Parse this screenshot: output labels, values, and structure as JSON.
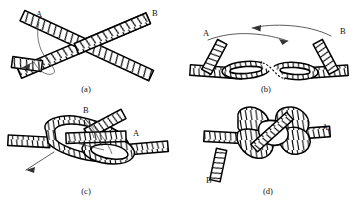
{
  "figure": {
    "background_color": "#ffffff",
    "ink_color": "#000000",
    "arrow_color": "#4a4a4a",
    "width": 356,
    "height": 203
  },
  "panels": [
    {
      "id": "a",
      "caption": "(a)",
      "caption_x": 86,
      "caption_y": 92,
      "description": "Two rope strands crossed in an X; end A at upper left, end B at upper right; curved arrow shows lower-left end being passed under",
      "labels": [
        {
          "name": "label-a",
          "text": "A",
          "x": 36,
          "y": 17
        },
        {
          "name": "label-b",
          "text": "B",
          "x": 152,
          "y": 16
        }
      ],
      "arrows": [
        {
          "name": "tuck-arrow",
          "direction": "down-left"
        }
      ]
    },
    {
      "id": "b",
      "caption": "(b)",
      "caption_x": 266,
      "caption_y": 92,
      "description": "First overhand twist formed; ends A and B lifted and swung toward each other as shown by the two opposing curved arrows",
      "labels": [
        {
          "name": "label-a",
          "text": "A",
          "x": 203,
          "y": 36
        },
        {
          "name": "label-b",
          "text": "B",
          "x": 340,
          "y": 34
        }
      ],
      "arrows": [
        {
          "name": "swing-left-arrow",
          "direction": "left"
        },
        {
          "name": "swing-right-arrow",
          "direction": "right"
        }
      ]
    },
    {
      "id": "c",
      "caption": "(c)",
      "caption_x": 86,
      "caption_y": 194,
      "description": "Second loop being formed; end B tucked up through the bight while end A lies to the right; arrow shows the standing part pulled down-left",
      "labels": [
        {
          "name": "label-b",
          "text": "B",
          "x": 83,
          "y": 113
        },
        {
          "name": "label-a",
          "text": "A",
          "x": 133,
          "y": 136
        }
      ],
      "arrows": [
        {
          "name": "tighten-arrow",
          "direction": "down-left"
        }
      ]
    },
    {
      "id": "d",
      "caption": "(d)",
      "caption_x": 268,
      "caption_y": 194,
      "description": "Completed knot drawn tight; end A exits to the right, end B hangs down at lower left",
      "labels": [
        {
          "name": "label-a",
          "text": "A",
          "x": 322,
          "y": 130
        },
        {
          "name": "label-b",
          "text": "B",
          "x": 206,
          "y": 183
        }
      ],
      "arrows": []
    }
  ]
}
